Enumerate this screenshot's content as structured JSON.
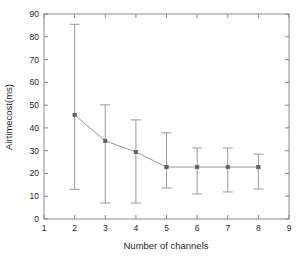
{
  "chart_data": {
    "type": "line",
    "title": "",
    "xlabel": "Number of channels",
    "ylabel": "Airtimecost(ms)",
    "xlim": [
      1,
      9
    ],
    "ylim": [
      0,
      90
    ],
    "xticks": [
      1,
      2,
      3,
      4,
      5,
      6,
      7,
      8,
      9
    ],
    "yticks": [
      0,
      10,
      20,
      30,
      40,
      50,
      60,
      70,
      80,
      90
    ],
    "xtick_labels": [
      "1",
      "2",
      "3",
      "4",
      "5",
      "6",
      "7",
      "8",
      "9"
    ],
    "ytick_labels": [
      "0",
      "10",
      "20",
      "30",
      "40",
      "50",
      "60",
      "70",
      "80",
      "90"
    ],
    "grid": false,
    "legend": null,
    "error_bars": true,
    "marker": "square",
    "line_color": "#9a9a9a",
    "marker_color": "#5e5e5e",
    "axis_color": "#8a8a8a",
    "background": "#ffffff",
    "x": [
      2,
      3,
      4,
      5,
      6,
      7,
      8
    ],
    "values": [
      45.7,
      34.3,
      29.4,
      22.8,
      22.8,
      22.8,
      22.8
    ],
    "err_low": [
      13.0,
      7.0,
      7.0,
      13.6,
      11.0,
      11.9,
      13.2
    ],
    "err_high": [
      85.5,
      50.1,
      43.5,
      37.8,
      31.2,
      31.2,
      28.5
    ],
    "series": [
      {
        "name": "Airtimecost",
        "points": [
          {
            "x": 2,
            "y": 45.7,
            "low": 13.0,
            "high": 85.5
          },
          {
            "x": 3,
            "y": 34.3,
            "low": 7.0,
            "high": 50.1
          },
          {
            "x": 4,
            "y": 29.4,
            "low": 7.0,
            "high": 43.5
          },
          {
            "x": 5,
            "y": 22.8,
            "low": 13.6,
            "high": 37.8
          },
          {
            "x": 6,
            "y": 22.8,
            "low": 11.0,
            "high": 31.2
          },
          {
            "x": 7,
            "y": 22.8,
            "low": 11.9,
            "high": 31.2
          },
          {
            "x": 8,
            "y": 22.8,
            "low": 13.2,
            "high": 28.5
          }
        ]
      }
    ]
  },
  "layout": {
    "plot_left": 44,
    "plot_right": 289,
    "plot_top": 14,
    "plot_bottom": 219
  }
}
